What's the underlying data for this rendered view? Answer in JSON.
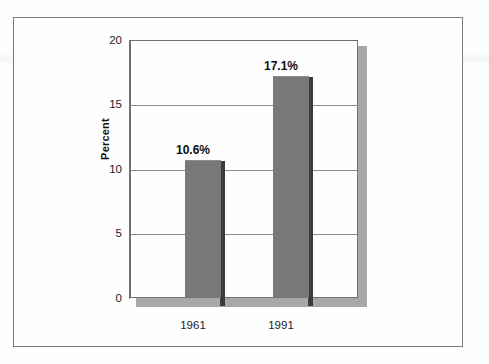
{
  "chart_data": {
    "type": "bar",
    "title": "",
    "subtitle": "",
    "xlabel": "",
    "ylabel": "Percent",
    "categories": [
      "1961",
      "1991"
    ],
    "values": [
      10.6,
      17.1
    ],
    "data_labels": [
      "10.6%",
      "17.1%"
    ],
    "ylim": [
      0,
      20
    ],
    "y_ticks": [
      0,
      5,
      10,
      15,
      20
    ],
    "y_tick_labels": [
      "0",
      "5",
      "10",
      "15",
      "20"
    ],
    "grid": "horizontal",
    "legend": "none",
    "series": [
      {
        "name": "Percent",
        "values": [
          10.6,
          17.1
        ]
      }
    ]
  },
  "style": {
    "bar_fill": "#787878",
    "bar_shadow": "#3c3c3c",
    "plot_shadow": "#a8a8a8",
    "axis_color": "#6f6f74",
    "grid_color": "#8a8a8e",
    "frame_color": "#7c7c80",
    "text_color": "#1c1c1c",
    "background": "#fefefe"
  }
}
